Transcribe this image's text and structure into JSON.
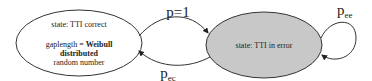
{
  "diagram": {
    "type": "state-transition",
    "colors": {
      "line": "#333333",
      "error_state_fill": "#c8c8c8",
      "correct_state_fill": "#ffffff",
      "background": "#ffffff"
    },
    "states": [
      {
        "id": "correct",
        "title": "state: TTI correct",
        "line1_prefix": "gaplength = ",
        "line1_bold": "Weibull",
        "line2_bold": "distributed",
        "line3": "random number"
      },
      {
        "id": "error",
        "title": "state: TTI in error"
      }
    ],
    "transitions": [
      {
        "from": "correct",
        "to": "error",
        "label_main": "p=1",
        "label_sub": ""
      },
      {
        "from": "error",
        "to": "correct",
        "label_main": "p",
        "label_sub": "ec"
      },
      {
        "from": "error",
        "to": "error",
        "label_main": "p",
        "label_sub": "ee"
      }
    ]
  }
}
